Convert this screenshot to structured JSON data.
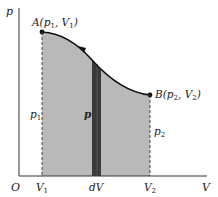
{
  "diagram": {
    "type": "p-V work diagram",
    "axes": {
      "origin_label": "O",
      "x_label": "V",
      "y_label": "p"
    },
    "points": [
      {
        "id": "A",
        "label": "A",
        "coords": "(p",
        "sub1": "1",
        "sep": ", V",
        "sub2": "1",
        "close": ")"
      },
      {
        "id": "B",
        "label": "B",
        "coords": "(p",
        "sub1": "2",
        "sep": ", V",
        "sub2": "2",
        "close": ")"
      }
    ],
    "x_ticks": [
      {
        "base": "V",
        "sub": "1"
      },
      {
        "base": "dV",
        "sub": ""
      },
      {
        "base": "V",
        "sub": "2"
      }
    ],
    "side_labels": {
      "p1": {
        "base": "p",
        "sub": "1"
      },
      "p2": {
        "base": "p",
        "sub": "2"
      },
      "p_strip": "p"
    },
    "colors": {
      "area_fill": "#b9b9b9",
      "strip_fill": "#3a3a3a",
      "curve": "#111111",
      "axes": "#333333"
    }
  }
}
